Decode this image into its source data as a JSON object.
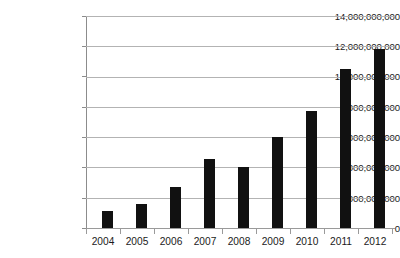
{
  "chart_data": {
    "type": "bar",
    "title": "",
    "subtitle": "",
    "xlabel": "",
    "ylabel": "",
    "categories": [
      "2004",
      "2005",
      "2006",
      "2007",
      "2008",
      "2009",
      "2010",
      "2011",
      "2012"
    ],
    "values": [
      1150000000,
      1600000000,
      2700000000,
      4550000000,
      4000000000,
      6000000000,
      7750000000,
      10500000000,
      11850000000
    ],
    "ylim": [
      0,
      14000000000
    ],
    "ytick_values": [
      0,
      2000000000,
      4000000000,
      6000000000,
      8000000000,
      10000000000,
      12000000000,
      14000000000
    ],
    "ytick_labels": [
      "0",
      "2,000,000,000",
      "4,000,000,000",
      "6,000,000,000",
      "8,000,000,000",
      "10,000,000,000",
      "12,000,000,000",
      "14,000,000,000"
    ],
    "grid": true,
    "legend": null,
    "legend_position": "none",
    "bar_color": "#111111",
    "gridline_color": "#b3b3b3",
    "axis_color": "#8c8c8c",
    "background_color": "#ffffff",
    "text_color": "#1a1a1a"
  }
}
